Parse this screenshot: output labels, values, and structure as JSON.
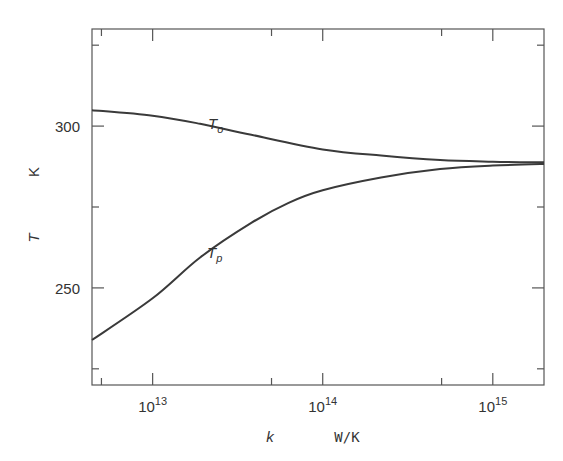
{
  "chart_data": {
    "type": "line",
    "title": "",
    "xlabel": "k",
    "xunit": "W/K",
    "ylabel": "T",
    "yunit": "K",
    "xscale": "log",
    "xlim": [
      4400000000000.0,
      2000000000000000.0
    ],
    "ylim": [
      220,
      330
    ],
    "xticks_major": [
      {
        "value": 10000000000000.0,
        "base": "10",
        "exp": "13"
      },
      {
        "value": 100000000000000.0,
        "base": "10",
        "exp": "14"
      },
      {
        "value": 1000000000000000.0,
        "base": "10",
        "exp": "15"
      }
    ],
    "xticks_minor": [
      5000000000000.0,
      50000000000000.0,
      500000000000000.0
    ],
    "yticks_major": [
      {
        "value": 300,
        "label": "300"
      },
      {
        "value": 250,
        "label": "250"
      }
    ],
    "yticks_minor": [
      325,
      275,
      225
    ],
    "grid": false,
    "legend": "none (inline curve labels)",
    "series": [
      {
        "name": "T_o",
        "label_main": "T",
        "label_sub": "o",
        "x": [
          4400000000000.0,
          10000000000000.0,
          19000000000000.0,
          38000000000000.0,
          100000000000000.0,
          220000000000000.0,
          490000000000000.0,
          1000000000000000.0,
          2000000000000000.0
        ],
        "values": [
          304.9,
          303.2,
          300.7,
          297.3,
          292.8,
          290.9,
          289.5,
          289.0,
          288.8
        ]
      },
      {
        "name": "T_p",
        "label_main": "T",
        "label_sub": "p",
        "x": [
          4400000000000.0,
          10000000000000.0,
          19000000000000.0,
          38000000000000.0,
          63000000000000.0,
          100000000000000.0,
          220000000000000.0,
          490000000000000.0,
          1000000000000000.0,
          2000000000000000.0
        ],
        "values": [
          233.9,
          246.8,
          259.4,
          270.1,
          276.3,
          280.2,
          284.1,
          286.7,
          287.8,
          288.3
        ]
      }
    ]
  },
  "colors": {
    "axis": "#555555",
    "line": "#3a3a3a",
    "text": "#333333"
  }
}
